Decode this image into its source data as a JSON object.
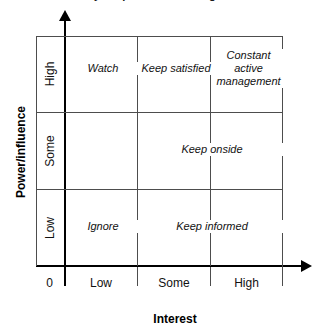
{
  "title_sliver": "Stakeholder analysis: power/influence grid",
  "chart_data": {
    "type": "table",
    "title": "",
    "xlabel": "Interest",
    "ylabel": "Power/influence",
    "grid": true,
    "legend": "none",
    "x_categories": [
      "Low",
      "Some",
      "High"
    ],
    "y_categories": [
      "Low",
      "Some",
      "High"
    ],
    "origin_label": "0",
    "cells": [
      {
        "row": "High",
        "col": "Low",
        "label": "Watch"
      },
      {
        "row": "High",
        "col": "Some",
        "label": "Keep satisfied"
      },
      {
        "row": "High",
        "col": "High",
        "label": "Constant active management"
      },
      {
        "row": "Some",
        "col": "Low",
        "label": ""
      },
      {
        "row": "Some",
        "col": "Some-High",
        "label": "Keep onside"
      },
      {
        "row": "Low",
        "col": "Low",
        "label": "Ignore"
      },
      {
        "row": "Low",
        "col": "Some-High",
        "label": "Keep informed"
      }
    ]
  },
  "axes": {
    "y": {
      "title": "Power/influence",
      "ticks": [
        "High",
        "Some",
        "Low"
      ],
      "origin": "0"
    },
    "x": {
      "title": "Interest",
      "ticks": [
        "Low",
        "Some",
        "High"
      ]
    }
  },
  "matrix": {
    "watch": "Watch",
    "keep_satisfied": "Keep satisfied",
    "constant_active_management": "Constant active management",
    "keep_onside": "Keep onside",
    "ignore": "Ignore",
    "keep_informed": "Keep informed"
  },
  "colors": {
    "axis": "#000000",
    "grid": "#4d4d4d",
    "text": "#111111",
    "background": "#ffffff"
  }
}
